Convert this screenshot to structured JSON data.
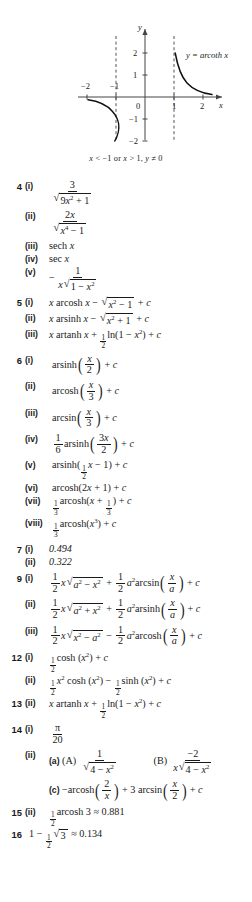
{
  "figure": {
    "curve_label": "y = arcoth x",
    "axis_x_label": "x",
    "axis_y_label": "y",
    "origin_label": "0",
    "x_ticks": [
      "-2",
      "-1",
      "1",
      "2"
    ],
    "y_ticks": [
      "2",
      "1",
      "-1",
      "-2"
    ],
    "caption_parts": {
      "a": "x",
      "b": " < ",
      "c": "−1 or ",
      "d": "x",
      "e": " > 1, ",
      "f": "y",
      "g": " ≠ 0"
    },
    "caption_full": "x < −1 or x > 1, y ≠ 0",
    "asymptotes": [
      "x = -1",
      "x = 1"
    ],
    "curve_name": "arcoth"
  },
  "answers": [
    {
      "q": "4",
      "items": [
        {
          "r": "(i)",
          "text": "3 / √(9x² + 1)"
        },
        {
          "r": "(ii)",
          "text": "2x / √(x⁴ − 1)"
        },
        {
          "r": "(iii)",
          "text": "sech x"
        },
        {
          "r": "(iv)",
          "text": "sec x"
        },
        {
          "r": "(v)",
          "text": "− 1 / (x√(1 − x²))"
        }
      ]
    },
    {
      "q": "5",
      "items": [
        {
          "r": "(i)",
          "text": "x arcosh x − √(x² − 1) + c"
        },
        {
          "r": "(ii)",
          "text": "x arsinh x − √(x² + 1) + c"
        },
        {
          "r": "(iii)",
          "text": "x artanh x + ½ ln(1 − x²) + c"
        }
      ]
    },
    {
      "q": "6",
      "items": [
        {
          "r": "(i)",
          "text": "arsinh(x/2) + c"
        },
        {
          "r": "(ii)",
          "text": "arcosh(x/3) + c"
        },
        {
          "r": "(iii)",
          "text": "arcsin(x/3) + c"
        },
        {
          "r": "(iv)",
          "text": "1/6 arsinh(3x/2) + c"
        },
        {
          "r": "(v)",
          "text": "arsinh(½x − 1) + c"
        },
        {
          "r": "(vi)",
          "text": "arcosh(2x + 1) + c"
        },
        {
          "r": "(vii)",
          "text": "⅓ arcosh(x + ⅓) + c"
        },
        {
          "r": "(viii)",
          "text": "⅓ arcosh(x³) + c"
        }
      ]
    },
    {
      "q": "7",
      "items": [
        {
          "r": "(i)",
          "text": "0.494"
        },
        {
          "r": "(ii)",
          "text": "0.322"
        }
      ]
    },
    {
      "q": "9",
      "items": [
        {
          "r": "(i)",
          "text": "½ x√(a² − x²) + ½ a² arcsin(x/a) + c"
        },
        {
          "r": "(ii)",
          "text": "½ x√(a² + x²) + ½ a² arsinh(x/a) + c"
        },
        {
          "r": "(iii)",
          "text": "½ x√(x² − a²) − ½ a² arcosh(x/a) + c"
        }
      ]
    },
    {
      "q": "12",
      "items": [
        {
          "r": "(i)",
          "text": "½ cosh (x²) + c"
        },
        {
          "r": "(ii)",
          "text": "½ x² cosh (x²) − ½ sinh (x²) + c"
        }
      ]
    },
    {
      "q": "13",
      "items": [
        {
          "r": "(ii)",
          "text": "x artanh x + ½ ln(1 − x²) + c"
        }
      ]
    },
    {
      "q": "14",
      "items": [
        {
          "r": "(i)",
          "text": "π/20"
        },
        {
          "r": "(ii)",
          "text": "(a) (A) 1/√(4 − x²)   (B) −2/(x√(4 − x²))"
        },
        {
          "r": "",
          "text": "(c) −arcosh(2/x) + 3 arcsin(x/2) + c"
        }
      ]
    },
    {
      "q": "15",
      "items": [
        {
          "r": "(ii)",
          "text": "½ arcosh 3 ≈ 0.881"
        }
      ]
    },
    {
      "q": "16",
      "items": [
        {
          "r": "",
          "text": "1 − ½√3 ≈ 0.134"
        }
      ]
    }
  ],
  "symbols": {
    "pi": "π",
    "approx": "≈",
    "minus": "−",
    "plus": "+",
    "c": "c",
    "sqrt": "√",
    "neq": "≠",
    "lt": "<",
    "gt": ">"
  },
  "sublabels": {
    "a": "(a)",
    "c": "(c)",
    "A": "(A)",
    "B": "(B)"
  },
  "colors": {
    "text": "#1a1a1a",
    "background": "#ffffff",
    "axis": "#444444",
    "curve": "#111111",
    "asymptote": "#555555"
  }
}
